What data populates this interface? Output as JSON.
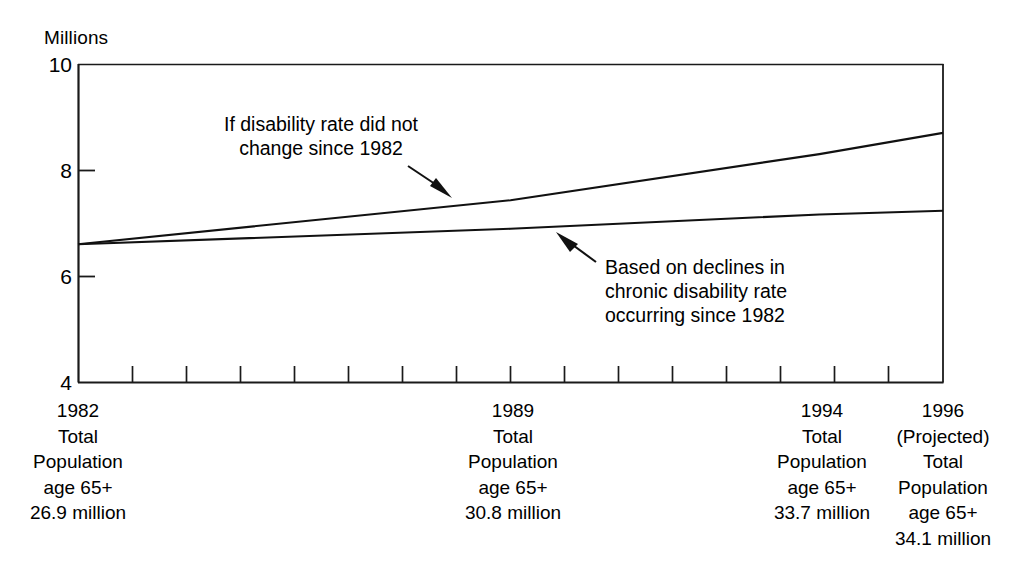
{
  "chart_data": {
    "type": "line",
    "title": "",
    "subtitle": "",
    "xlabel": "",
    "ylabel": "Millions",
    "ylim": [
      4,
      10
    ],
    "ytick_labels": [
      "10",
      "8",
      "6",
      "4"
    ],
    "ytick_values": [
      10,
      8,
      6,
      4
    ],
    "grid": false,
    "legend_position": "inline-annotations",
    "x_axis_minor_tick_count": 15,
    "categories": [
      "1982",
      "1989",
      "1994",
      "1996"
    ],
    "x": [
      1982,
      1989,
      1994,
      1996
    ],
    "series": [
      {
        "name": "If disability rate did not change since 1982",
        "values": [
          6.6,
          7.43,
          8.3,
          8.7
        ]
      },
      {
        "name": "Based on declines in chronic disability rate occurring since 1982",
        "values": [
          6.6,
          6.89,
          7.16,
          7.23
        ]
      }
    ],
    "annotations": [
      {
        "id": "upper-line-annotation",
        "lines": [
          "If disability rate did not",
          "change since 1982"
        ],
        "points_to_series": "If disability rate did not change since 1982"
      },
      {
        "id": "lower-line-annotation",
        "lines": [
          "Based on declines in",
          "chronic disability rate",
          "occurring since 1982"
        ],
        "points_to_series": "Based on declines in chronic disability rate occurring since 1982"
      }
    ],
    "x_category_labels": [
      {
        "year": "1982",
        "lines": [
          "1982",
          "Total",
          "Population",
          "age 65+",
          "26.9 million"
        ]
      },
      {
        "year": "1989",
        "lines": [
          "1989",
          "Total",
          "Population",
          "age 65+",
          "30.8 million"
        ]
      },
      {
        "year": "1994",
        "lines": [
          "1994",
          "Total",
          "Population",
          "age 65+",
          "33.7 million"
        ]
      },
      {
        "year": "1996",
        "lines": [
          "1996",
          "(Projected)",
          "Total",
          "Population",
          "age 65+",
          "34.1 million"
        ]
      }
    ],
    "colors": {
      "background": "#ffffff",
      "ink": "#000000",
      "line": "#1a1a1a",
      "axis": "#1a1a1a"
    }
  },
  "axis": {
    "y_title": "Millions",
    "ticks": {
      "t10": "10",
      "t8": "8",
      "t6": "6",
      "t4": "4"
    }
  },
  "annotations": {
    "upper": {
      "line1": "If disability rate did not",
      "line2": "change since 1982"
    },
    "lower": {
      "line1": "Based on declines in",
      "line2": "chronic disability rate",
      "line3": "occurring since 1982"
    }
  },
  "xlabels": {
    "c0": {
      "l0": "1982",
      "l1": "Total",
      "l2": "Population",
      "l3": "age 65+",
      "l4": "26.9 million"
    },
    "c1": {
      "l0": "1989",
      "l1": "Total",
      "l2": "Population",
      "l3": "age 65+",
      "l4": "30.8 million"
    },
    "c2": {
      "l0": "1994",
      "l1": "Total",
      "l2": "Population",
      "l3": "age 65+",
      "l4": "33.7 million"
    },
    "c3": {
      "l0": "1996",
      "l1": "(Projected)",
      "l2": "Total",
      "l3": "Population",
      "l4": "age 65+",
      "l5": "34.1 million"
    }
  }
}
